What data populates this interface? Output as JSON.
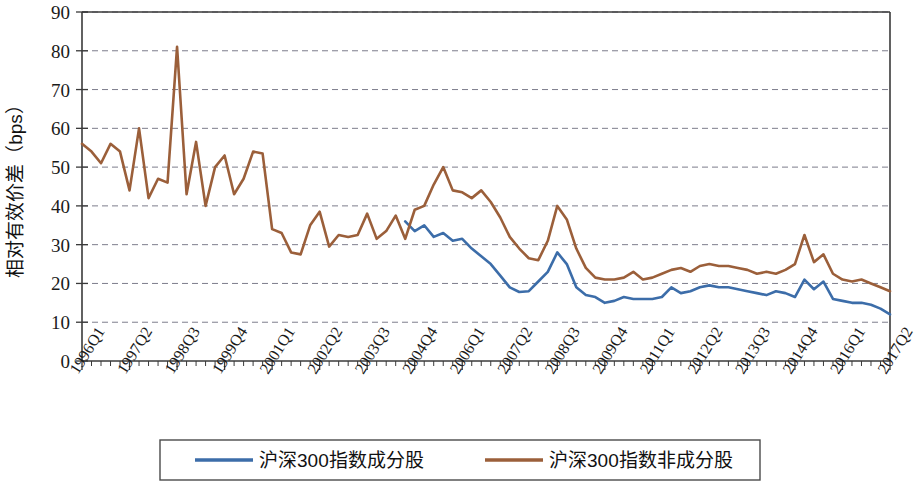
{
  "chart_data": {
    "type": "line",
    "title": "",
    "xlabel": "",
    "ylabel": "相对有效价差（bps）",
    "ylim": [
      0,
      90
    ],
    "ytick_step": 10,
    "yticks": [
      0,
      10,
      20,
      30,
      40,
      50,
      60,
      70,
      80,
      90
    ],
    "grid": "horizontal-dashed",
    "legend_position": "bottom",
    "x_tick_labels": [
      "1996Q1",
      "1997Q2",
      "1998Q3",
      "1999Q4",
      "2001Q1",
      "2002Q2",
      "2003Q3",
      "2004Q4",
      "2006Q1",
      "2007Q2",
      "2008Q3",
      "2009Q4",
      "2011Q1",
      "2012Q2",
      "2013Q3",
      "2014Q4",
      "2016Q1",
      "2017Q2"
    ],
    "x_tick_label_interval": 5,
    "x": [
      "1996Q1",
      "1996Q2",
      "1996Q3",
      "1996Q4",
      "1997Q1",
      "1997Q2",
      "1997Q3",
      "1997Q4",
      "1998Q1",
      "1998Q2",
      "1998Q3",
      "1998Q4",
      "1999Q1",
      "1999Q2",
      "1999Q3",
      "1999Q4",
      "2000Q1",
      "2000Q2",
      "2000Q3",
      "2000Q4",
      "2001Q1",
      "2001Q2",
      "2001Q3",
      "2001Q4",
      "2002Q1",
      "2002Q2",
      "2002Q3",
      "2002Q4",
      "2003Q1",
      "2003Q2",
      "2003Q3",
      "2003Q4",
      "2004Q1",
      "2004Q2",
      "2004Q3",
      "2004Q4",
      "2005Q1",
      "2005Q2",
      "2005Q3",
      "2005Q4",
      "2006Q1",
      "2006Q2",
      "2006Q3",
      "2006Q4",
      "2007Q1",
      "2007Q2",
      "2007Q3",
      "2007Q4",
      "2008Q1",
      "2008Q2",
      "2008Q3",
      "2008Q4",
      "2009Q1",
      "2009Q2",
      "2009Q3",
      "2009Q4",
      "2010Q1",
      "2010Q2",
      "2010Q3",
      "2010Q4",
      "2011Q1",
      "2011Q2",
      "2011Q3",
      "2011Q4",
      "2012Q1",
      "2012Q2",
      "2012Q3",
      "2012Q4",
      "2013Q1",
      "2013Q2",
      "2013Q3",
      "2013Q4",
      "2014Q1",
      "2014Q2",
      "2014Q3",
      "2014Q4",
      "2015Q1",
      "2015Q2",
      "2015Q3",
      "2015Q4",
      "2016Q1",
      "2016Q2",
      "2016Q3",
      "2016Q4",
      "2017Q1",
      "2017Q2"
    ],
    "series": [
      {
        "name": "沪深300指数成分股",
        "color": "#3c6da9",
        "start_index": 34,
        "values": [
          null,
          null,
          null,
          null,
          null,
          null,
          null,
          null,
          null,
          null,
          null,
          null,
          null,
          null,
          null,
          null,
          null,
          null,
          null,
          null,
          null,
          null,
          null,
          null,
          null,
          null,
          null,
          null,
          null,
          null,
          null,
          null,
          null,
          null,
          36.0,
          33.5,
          35.0,
          32.0,
          33.0,
          31.0,
          31.5,
          29.0,
          27.0,
          25.0,
          22.0,
          19.0,
          17.8,
          18.0,
          20.5,
          23.0,
          28.0,
          25.0,
          19.0,
          17.0,
          16.5,
          15.0,
          15.5,
          16.5,
          16.0,
          16.0,
          16.0,
          16.5,
          19.0,
          17.5,
          18.0,
          19.0,
          19.5,
          19.0,
          19.0,
          18.5,
          18.0,
          17.5,
          17.0,
          18.0,
          17.5,
          16.5,
          21.0,
          18.5,
          20.5,
          16.0,
          15.5,
          15.0,
          15.0,
          14.5,
          13.5,
          12.0
        ]
      },
      {
        "name": "沪深300指数非成分股",
        "color": "#9b5f3a",
        "start_index": 0,
        "values": [
          56.0,
          54.0,
          51.0,
          56.0,
          54.0,
          44.0,
          60.0,
          42.0,
          47.0,
          46.0,
          81.0,
          43.0,
          56.5,
          40.0,
          50.0,
          53.0,
          43.0,
          47.0,
          54.0,
          53.5,
          34.0,
          33.0,
          28.0,
          27.5,
          35.0,
          38.5,
          29.5,
          32.5,
          32.0,
          32.5,
          38.0,
          31.5,
          33.5,
          37.5,
          31.5,
          39.0,
          40.0,
          45.5,
          50.0,
          44.0,
          43.5,
          42.0,
          44.0,
          41.0,
          37.0,
          32.0,
          29.0,
          26.5,
          26.0,
          31.0,
          40.0,
          36.5,
          29.0,
          24.0,
          21.5,
          21.0,
          21.0,
          21.5,
          23.0,
          21.0,
          21.5,
          22.5,
          23.5,
          24.0,
          23.0,
          24.5,
          25.0,
          24.5,
          24.5,
          24.0,
          23.5,
          22.5,
          23.0,
          22.5,
          23.5,
          25.0,
          32.5,
          25.5,
          27.5,
          22.5,
          21.0,
          20.5,
          21.0,
          20.0,
          19.0,
          18.0
        ]
      }
    ]
  },
  "legend": {
    "items": [
      {
        "label": "沪深300指数成分股",
        "color": "#3c6da9"
      },
      {
        "label": "沪深300指数非成分股",
        "color": "#9b5f3a"
      }
    ]
  }
}
